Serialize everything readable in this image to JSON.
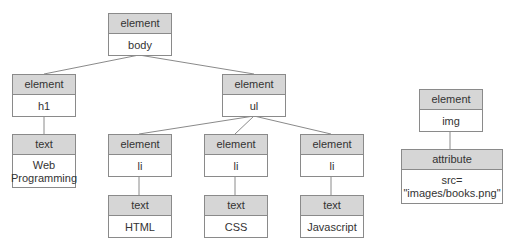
{
  "diagram": {
    "title": "",
    "nodes": [
      {
        "id": "body",
        "type": "element",
        "value": "body"
      },
      {
        "id": "h1",
        "type": "element",
        "value": "h1"
      },
      {
        "id": "ul",
        "type": "element",
        "value": "ul"
      },
      {
        "id": "text-web",
        "type": "text",
        "value": "Web\nProgramming"
      },
      {
        "id": "li1",
        "type": "element",
        "value": "li"
      },
      {
        "id": "li2",
        "type": "element",
        "value": "li"
      },
      {
        "id": "li3",
        "type": "element",
        "value": "li"
      },
      {
        "id": "text-html",
        "type": "text",
        "value": "HTML"
      },
      {
        "id": "text-css",
        "type": "text",
        "value": "CSS"
      },
      {
        "id": "text-js",
        "type": "text",
        "value": "Javascript"
      },
      {
        "id": "img",
        "type": "element",
        "value": "img"
      },
      {
        "id": "attr-src",
        "type": "attribute",
        "value": "src=\n\"images/books.png\""
      }
    ],
    "edges": [
      [
        "body",
        "h1"
      ],
      [
        "body",
        "ul"
      ],
      [
        "h1",
        "text-web"
      ],
      [
        "ul",
        "li1"
      ],
      [
        "ul",
        "li2"
      ],
      [
        "ul",
        "li3"
      ],
      [
        "li1",
        "text-html"
      ],
      [
        "li2",
        "text-css"
      ],
      [
        "li3",
        "text-js"
      ],
      [
        "img",
        "attr-src"
      ]
    ]
  }
}
